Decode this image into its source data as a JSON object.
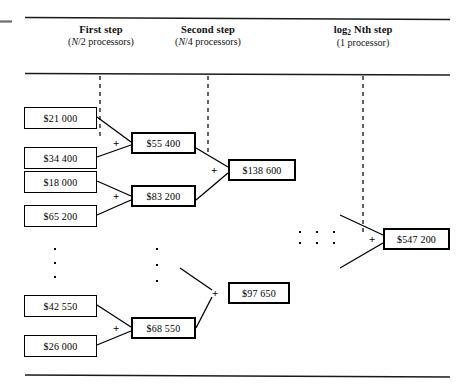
{
  "figure": {
    "ink_color": "#000000",
    "background": "#ffffff"
  },
  "headers": [
    {
      "id": "first-step",
      "title": "First step",
      "sub_prefix": "(",
      "sub_var": "N",
      "sub_rest": "/2 processors)"
    },
    {
      "id": "second-step",
      "title": "Second step",
      "sub_prefix": "(",
      "sub_var": "N",
      "sub_rest": "/4 processors)"
    },
    {
      "id": "log-nth-step",
      "title_pre": "log",
      "title_sub": "2",
      "title_var": "N",
      "title_post": "th step",
      "sub_full": "(1 processor)"
    }
  ],
  "leaf_boxes": [
    {
      "id": "leaf-1",
      "value": "$21 000"
    },
    {
      "id": "leaf-2",
      "value": "$34 400"
    },
    {
      "id": "leaf-3",
      "value": "$18 000"
    },
    {
      "id": "leaf-4",
      "value": "$65 200"
    },
    {
      "id": "leaf-5",
      "value": "$42 550"
    },
    {
      "id": "leaf-6",
      "value": "$26 000"
    }
  ],
  "first_step_boxes": [
    {
      "id": "sum-1",
      "value": "$55 400"
    },
    {
      "id": "sum-2",
      "value": "$83 200"
    },
    {
      "id": "sum-3",
      "value": "$68 550"
    }
  ],
  "second_step_boxes": [
    {
      "id": "sum-4",
      "value": "$138 600"
    },
    {
      "id": "sum-5",
      "value": "$97 650"
    }
  ],
  "final_box": {
    "id": "sum-final",
    "value": "$547 200"
  },
  "operators": {
    "plus": "+"
  }
}
